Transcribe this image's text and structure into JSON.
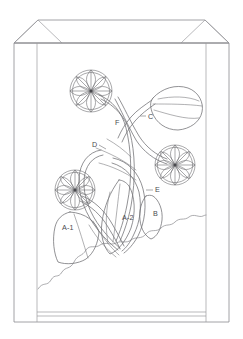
{
  "figure": {
    "background_color": "#ffffff",
    "line_color": "#6e6e72",
    "bag_line_color": "#8b8b8f",
    "label_color": "#4a4a4e"
  },
  "bag": {
    "name": "paper-bag-outline",
    "left_gusset_label": "left-gusset-panel",
    "right_gusset_label": "right-gusset-panel",
    "front_panel_label": "front-panel",
    "bottom_band_label": "bottom-fold-band",
    "top_flap_label": "top-flap"
  },
  "callouts": [
    {
      "id": "A-1",
      "label": "A-1",
      "x": 62,
      "y": 230,
      "has_leader": false
    },
    {
      "id": "A-2",
      "label": "A-2",
      "x": 122,
      "y": 220,
      "has_leader": false
    },
    {
      "id": "B",
      "label": "B",
      "x": 153,
      "y": 216,
      "has_leader": false
    },
    {
      "id": "C",
      "label": "C",
      "x": 148,
      "y": 119,
      "has_leader": true
    },
    {
      "id": "D",
      "label": "D",
      "x": 92,
      "y": 147,
      "has_leader": true
    },
    {
      "id": "E",
      "label": "E",
      "x": 155,
      "y": 192,
      "has_leader": true
    },
    {
      "id": "F",
      "label": "F",
      "x": 115,
      "y": 125,
      "has_leader": false
    }
  ],
  "elements": {
    "flower_top_left": "flower-rosette-top-left",
    "flower_right": "flower-rosette-right",
    "flower_bottom_left": "flower-rosette-bottom-left",
    "bud_top_right": "leaf-bud-top-right",
    "stems": "stem-bundle",
    "leaves": "leaf-cluster",
    "waterline": "water-line"
  }
}
